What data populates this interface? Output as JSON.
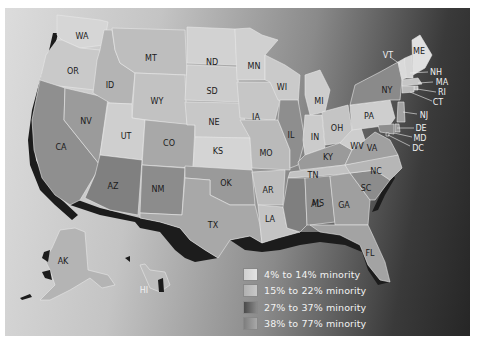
{
  "map": {
    "type": "choropleth",
    "subject": "Percent minority population by U.S. state",
    "colors": {
      "cat1": "#d9d9d9",
      "cat2": "#b8b8b8",
      "cat3": "#6e6e6e",
      "cat4": "#959595",
      "coast_shadow": "#1c1c1c",
      "frame_light": "#dcdcdc",
      "frame_dark": "#262626"
    },
    "states": {
      "WA": "WA",
      "OR": "OR",
      "CA": "CA",
      "NV": "NV",
      "ID": "ID",
      "MT": "MT",
      "WY": "WY",
      "UT": "UT",
      "AZ": "AZ",
      "CO": "CO",
      "NM": "NM",
      "ND": "ND",
      "SD": "SD",
      "NE": "NE",
      "KS": "KS",
      "OK": "OK",
      "TX": "TX",
      "MN": "MN",
      "IA": "IA",
      "MO": "MO",
      "AR": "AR",
      "LA": "LA",
      "WI": "WI",
      "IL": "IL",
      "MS": "MS",
      "MI": "MI",
      "IN": "IN",
      "KY": "KY",
      "TN": "TN",
      "AL": "AL",
      "OH": "OH",
      "WV": "WV",
      "GA": "GA",
      "FL": "FL",
      "SC": "SC",
      "NC": "NC",
      "VA": "VA",
      "PA": "PA",
      "NY": "NY",
      "VT": "VT",
      "ME": "ME",
      "NH": "NH",
      "MA": "MA",
      "RI": "RI",
      "CT": "CT",
      "NJ": "NJ",
      "DE": "DE",
      "MD": "MD",
      "DC": "DC",
      "AK": "AK",
      "HI": "HI"
    }
  },
  "legend": {
    "items": [
      {
        "label": "4% to 14% minority",
        "color": "#d9d9d9"
      },
      {
        "label": "15% to 22% minority",
        "color": "#b8b8b8"
      },
      {
        "label": "27% to 37% minority",
        "color": "#6e6e6e"
      },
      {
        "label": "38% to 77% minority",
        "color": "#959595"
      }
    ]
  }
}
